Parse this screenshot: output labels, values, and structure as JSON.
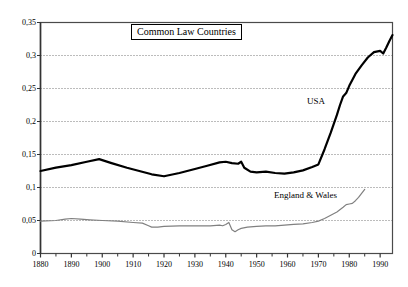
{
  "chart_data": {
    "type": "line",
    "title": "Common Law Countries",
    "xlabel": "",
    "ylabel": "",
    "xlim": [
      1880,
      1994
    ],
    "ylim": [
      0,
      0.35
    ],
    "grid": true,
    "grid_orientation": "horizontal",
    "legend_position": "inline-annotation",
    "y_tick_labels": [
      "0,35",
      "0,3",
      "0,25",
      "0,2",
      "0,15",
      "0,1",
      "0,05",
      "0"
    ],
    "y_tick_values": [
      0.35,
      0.3,
      0.25,
      0.2,
      0.15,
      0.1,
      0.05,
      0
    ],
    "x_tick_labels": [
      "1880",
      "1890",
      "1900",
      "1910",
      "1920",
      "1930",
      "1940",
      "1950",
      "1960",
      "1970",
      "1980",
      "1990"
    ],
    "x_tick_values": [
      1880,
      1890,
      1900,
      1910,
      1920,
      1930,
      1940,
      1950,
      1960,
      1970,
      1980,
      1990
    ],
    "x_minor_tick_values": [
      1885,
      1895,
      1905,
      1915,
      1925,
      1935,
      1945,
      1955,
      1965,
      1975,
      1985
    ],
    "series": [
      {
        "name": "USA",
        "color": "#000000",
        "line_width": 2.2,
        "x": [
          1880,
          1885,
          1890,
          1895,
          1899,
          1903,
          1908,
          1912,
          1916,
          1920,
          1925,
          1930,
          1934,
          1938,
          1940,
          1942,
          1944,
          1945,
          1946,
          1948,
          1950,
          1953,
          1956,
          1959,
          1962,
          1965,
          1968,
          1970,
          1972,
          1974,
          1976,
          1977,
          1978,
          1979,
          1980,
          1982,
          1984,
          1986,
          1988,
          1990,
          1991,
          1992,
          1993,
          1994
        ],
        "y": [
          0.125,
          0.13,
          0.134,
          0.139,
          0.143,
          0.137,
          0.13,
          0.125,
          0.12,
          0.117,
          0.122,
          0.128,
          0.133,
          0.138,
          0.139,
          0.137,
          0.136,
          0.139,
          0.13,
          0.124,
          0.123,
          0.124,
          0.122,
          0.121,
          0.123,
          0.126,
          0.131,
          0.135,
          0.158,
          0.183,
          0.21,
          0.225,
          0.238,
          0.243,
          0.254,
          0.272,
          0.285,
          0.297,
          0.305,
          0.307,
          0.303,
          0.312,
          0.322,
          0.331
        ]
      },
      {
        "name": "England & Wales",
        "color": "#808080",
        "line_width": 1.2,
        "x": [
          1880,
          1885,
          1888,
          1890,
          1893,
          1896,
          1900,
          1905,
          1910,
          1913,
          1915,
          1916,
          1918,
          1920,
          1925,
          1930,
          1935,
          1938,
          1939,
          1940,
          1941,
          1942,
          1943,
          1944,
          1945,
          1947,
          1950,
          1953,
          1956,
          1959,
          1962,
          1965,
          1968,
          1970,
          1972,
          1974,
          1976,
          1978,
          1979,
          1980,
          1981,
          1982,
          1983,
          1984,
          1985
        ],
        "y": [
          0.049,
          0.05,
          0.052,
          0.053,
          0.052,
          0.051,
          0.05,
          0.049,
          0.047,
          0.046,
          0.042,
          0.04,
          0.04,
          0.041,
          0.042,
          0.042,
          0.042,
          0.043,
          0.042,
          0.044,
          0.047,
          0.036,
          0.033,
          0.036,
          0.038,
          0.04,
          0.041,
          0.042,
          0.042,
          0.043,
          0.044,
          0.045,
          0.047,
          0.049,
          0.053,
          0.058,
          0.063,
          0.07,
          0.074,
          0.075,
          0.076,
          0.08,
          0.085,
          0.091,
          0.097
        ]
      }
    ],
    "annotations": [
      {
        "text": "USA",
        "x": 1975,
        "y": 0.215
      },
      {
        "text": "England & Wales",
        "x": 1962,
        "y": 0.105
      }
    ]
  }
}
